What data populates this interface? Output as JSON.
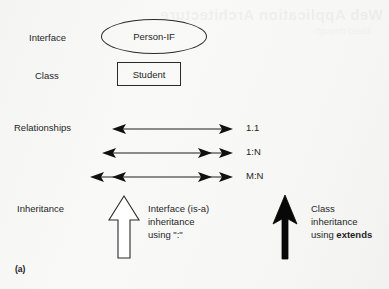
{
  "figure": {
    "caption": "(a)",
    "watermark": "Web Application Architecture",
    "watermark_sub": "bleed-through"
  },
  "rows": {
    "interface_label": "Interface",
    "class_label": "Class",
    "relationships_label": "Relationships",
    "inheritance_label": "Inheritance"
  },
  "nodes": {
    "interface": {
      "shape": "ellipse",
      "text": "Person-IF"
    },
    "class": {
      "shape": "rectangle",
      "text": "Student"
    }
  },
  "relationships": [
    {
      "cardinality": "1.1",
      "left_heads": 1,
      "right_heads": 1,
      "name": "one-to-one"
    },
    {
      "cardinality": "1:N",
      "left_heads": 1,
      "right_heads": 2,
      "name": "one-to-many"
    },
    {
      "cardinality": "M:N",
      "left_heads": 2,
      "right_heads": 2,
      "name": "many-to-many"
    }
  ],
  "inheritance": {
    "hollow": {
      "arrow_style": "hollow-outline",
      "line1": "Interface (is-a)",
      "line2": "inheritance",
      "line3_prefix": "using ",
      "line3_keyword": "\":\"",
      "line3_bold": false
    },
    "solid": {
      "arrow_style": "solid-black",
      "line1": "Class",
      "line2": "inheritance",
      "line3_prefix": "using ",
      "line3_keyword": "extends",
      "line3_bold": true
    }
  },
  "colors": {
    "background": "#f7f7f6",
    "stroke": "#1f1f1f",
    "text": "#1a1a1a",
    "hollow_fill": "#ffffff"
  }
}
